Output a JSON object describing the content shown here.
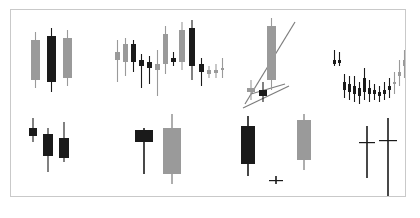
{
  "figure": {
    "title": "",
    "background_color": "#ffffff",
    "border_color": "#c9c9c9",
    "bullish_color": "#9a9a9a",
    "bearish_color": "#1a1a1a",
    "line_color": "#7d7d7d",
    "panel": {
      "x": 10,
      "y": 9,
      "width": 396,
      "height": 188
    }
  },
  "chart_data": {
    "type": "candlestick",
    "title": "",
    "subtitle": "",
    "xlabel": "",
    "ylabel": "",
    "grid": false,
    "legend": null,
    "axis_ticks_visible": false,
    "colors": {
      "up": "#9a9a9a",
      "down": "#1a1a1a",
      "trendline": "#7d7d7d"
    },
    "panels": [
      {
        "id": "panel-1",
        "name": "three-wide-candles",
        "position": {
          "x": 8,
          "y": 12,
          "w": 92,
          "h": 80
        },
        "ylim": [
          0,
          80
        ],
        "candles": [
          {
            "x": 12,
            "open": 62,
            "high": 70,
            "low": 14,
            "close": 22,
            "dir": "up",
            "body_w": 9
          },
          {
            "x": 28,
            "open": 66,
            "high": 74,
            "low": 10,
            "close": 20,
            "dir": "down",
            "body_w": 9
          },
          {
            "x": 44,
            "open": 64,
            "high": 72,
            "low": 16,
            "close": 24,
            "dir": "up",
            "body_w": 9
          }
        ],
        "trendlines": []
      },
      {
        "id": "panel-2",
        "name": "mixed-sequence",
        "position": {
          "x": 100,
          "y": 8,
          "w": 118,
          "h": 88
        },
        "ylim": [
          0,
          88
        ],
        "candles": [
          {
            "x": 4,
            "open": 54,
            "high": 66,
            "low": 24,
            "close": 46,
            "dir": "up",
            "body_w": 5
          },
          {
            "x": 12,
            "open": 62,
            "high": 68,
            "low": 30,
            "close": 44,
            "dir": "up",
            "body_w": 5
          },
          {
            "x": 20,
            "open": 62,
            "high": 66,
            "low": 34,
            "close": 44,
            "dir": "down",
            "body_w": 5
          },
          {
            "x": 28,
            "open": 46,
            "high": 52,
            "low": 18,
            "close": 40,
            "dir": "down",
            "body_w": 5
          },
          {
            "x": 36,
            "open": 44,
            "high": 50,
            "low": 22,
            "close": 38,
            "dir": "down",
            "body_w": 5
          },
          {
            "x": 44,
            "open": 42,
            "high": 56,
            "low": 10,
            "close": 36,
            "dir": "up",
            "body_w": 5
          },
          {
            "x": 52,
            "open": 72,
            "high": 80,
            "low": 32,
            "close": 42,
            "dir": "up",
            "body_w": 5
          },
          {
            "x": 60,
            "open": 48,
            "high": 54,
            "low": 40,
            "close": 44,
            "dir": "down",
            "body_w": 5
          },
          {
            "x": 68,
            "open": 76,
            "high": 84,
            "low": 36,
            "close": 44,
            "dir": "up",
            "body_w": 6
          },
          {
            "x": 78,
            "open": 78,
            "high": 86,
            "low": 26,
            "close": 40,
            "dir": "down",
            "body_w": 6
          },
          {
            "x": 88,
            "open": 42,
            "high": 48,
            "low": 20,
            "close": 34,
            "dir": "down",
            "body_w": 5
          },
          {
            "x": 96,
            "open": 36,
            "high": 40,
            "low": 28,
            "close": 32,
            "dir": "up",
            "body_w": 4
          },
          {
            "x": 103,
            "open": 36,
            "high": 42,
            "low": 28,
            "close": 33,
            "dir": "up",
            "body_w": 4
          },
          {
            "x": 110,
            "open": 38,
            "high": 48,
            "low": 28,
            "close": 36,
            "dir": "up",
            "body_w": 3
          }
        ],
        "trendlines": []
      },
      {
        "id": "panel-3",
        "name": "wedge-breakout-with-trendlines",
        "position": {
          "x": 222,
          "y": 6,
          "w": 94,
          "h": 98
        },
        "ylim": [
          0,
          98
        ],
        "candles": [
          {
            "x": 14,
            "open": 26,
            "high": 34,
            "low": 14,
            "close": 22,
            "dir": "up",
            "body_w": 8
          },
          {
            "x": 26,
            "open": 24,
            "high": 32,
            "low": 12,
            "close": 18,
            "dir": "down",
            "body_w": 8
          },
          {
            "x": 34,
            "open": 88,
            "high": 96,
            "low": 24,
            "close": 34,
            "dir": "up",
            "body_w": 9
          }
        ],
        "trendlines": [
          {
            "name": "upper-trendline",
            "x1": 12,
            "y1": 10,
            "x2": 62,
            "y2": 92
          },
          {
            "name": "lower-trendline",
            "x1": 10,
            "y1": 6,
            "x2": 56,
            "y2": 28
          },
          {
            "name": "breakout-line",
            "x1": 18,
            "y1": 20,
            "x2": 52,
            "y2": 30
          }
        ]
      },
      {
        "id": "panel-4",
        "name": "rounding-bottom-rally",
        "position": {
          "x": 318,
          "y": 6,
          "w": 88,
          "h": 96
        },
        "ylim": [
          0,
          96
        ],
        "candles": [
          {
            "x": 4,
            "open": 52,
            "high": 62,
            "low": 46,
            "close": 48,
            "dir": "down",
            "body_w": 3
          },
          {
            "x": 9,
            "open": 52,
            "high": 60,
            "low": 46,
            "close": 49,
            "dir": "down",
            "body_w": 3
          },
          {
            "x": 14,
            "open": 30,
            "high": 38,
            "low": 14,
            "close": 22,
            "dir": "down",
            "body_w": 3
          },
          {
            "x": 19,
            "open": 28,
            "high": 36,
            "low": 12,
            "close": 20,
            "dir": "down",
            "body_w": 3
          },
          {
            "x": 24,
            "open": 26,
            "high": 36,
            "low": 10,
            "close": 18,
            "dir": "down",
            "body_w": 3
          },
          {
            "x": 29,
            "open": 24,
            "high": 30,
            "low": 8,
            "close": 16,
            "dir": "down",
            "body_w": 3
          },
          {
            "x": 34,
            "open": 34,
            "high": 44,
            "low": 12,
            "close": 20,
            "dir": "down",
            "body_w": 3
          },
          {
            "x": 39,
            "open": 24,
            "high": 32,
            "low": 10,
            "close": 18,
            "dir": "down",
            "body_w": 3
          },
          {
            "x": 44,
            "open": 22,
            "high": 28,
            "low": 12,
            "close": 18,
            "dir": "down",
            "body_w": 3
          },
          {
            "x": 49,
            "open": 20,
            "high": 26,
            "low": 10,
            "close": 16,
            "dir": "down",
            "body_w": 3
          },
          {
            "x": 54,
            "open": 22,
            "high": 30,
            "low": 12,
            "close": 18,
            "dir": "down",
            "body_w": 3
          },
          {
            "x": 59,
            "open": 26,
            "high": 34,
            "low": 14,
            "close": 22,
            "dir": "down",
            "body_w": 3
          },
          {
            "x": 64,
            "open": 30,
            "high": 40,
            "low": 18,
            "close": 28,
            "dir": "up",
            "body_w": 3
          },
          {
            "x": 69,
            "open": 40,
            "high": 52,
            "low": 26,
            "close": 36,
            "dir": "up",
            "body_w": 3
          },
          {
            "x": 74,
            "open": 52,
            "high": 62,
            "low": 34,
            "close": 46,
            "dir": "up",
            "body_w": 3
          },
          {
            "x": 80,
            "open": 84,
            "high": 94,
            "low": 66,
            "close": 74,
            "dir": "down",
            "body_w": 5
          }
        ],
        "trendlines": []
      },
      {
        "id": "panel-5",
        "name": "three-black-crows",
        "position": {
          "x": 8,
          "y": 100,
          "w": 80,
          "h": 80
        },
        "ylim": [
          0,
          80
        ],
        "candles": [
          {
            "x": 10,
            "open": 62,
            "high": 72,
            "low": 48,
            "close": 54,
            "dir": "down",
            "body_w": 8
          },
          {
            "x": 24,
            "open": 56,
            "high": 62,
            "low": 18,
            "close": 34,
            "dir": "down",
            "body_w": 10
          },
          {
            "x": 40,
            "open": 52,
            "high": 68,
            "low": 28,
            "close": 32,
            "dir": "down",
            "body_w": 10
          }
        ],
        "trendlines": []
      },
      {
        "id": "panel-6",
        "name": "bullish-engulfing",
        "position": {
          "x": 110,
          "y": 100,
          "w": 90,
          "h": 82
        },
        "ylim": [
          0,
          82
        ],
        "candles": [
          {
            "x": 14,
            "open": 62,
            "high": 64,
            "low": 18,
            "close": 50,
            "dir": "down",
            "body_w": 18
          },
          {
            "x": 42,
            "open": 18,
            "high": 78,
            "low": 8,
            "close": 64,
            "dir": "up",
            "body_w": 18
          }
        ],
        "trendlines": []
      },
      {
        "id": "panel-7",
        "name": "morning-star",
        "position": {
          "x": 216,
          "y": 100,
          "w": 96,
          "h": 86
        },
        "ylim": [
          0,
          86
        ],
        "candles": [
          {
            "x": 14,
            "open": 70,
            "high": 80,
            "low": 20,
            "close": 32,
            "dir": "down",
            "body_w": 14
          },
          {
            "x": 42,
            "open": 16,
            "high": 20,
            "low": 12,
            "close": 16,
            "dir": "doji",
            "body_w": 14
          },
          {
            "x": 70,
            "open": 36,
            "high": 82,
            "low": 26,
            "close": 76,
            "dir": "up",
            "body_w": 14
          }
        ],
        "trendlines": []
      },
      {
        "id": "panel-8",
        "name": "double-dragonfly-doji",
        "position": {
          "x": 330,
          "y": 100,
          "w": 76,
          "h": 88
        },
        "ylim": [
          0,
          88
        ],
        "candles": [
          {
            "x": 18,
            "open": 56,
            "high": 72,
            "low": 20,
            "close": 56,
            "dir": "doji",
            "body_w": 16
          },
          {
            "x": 38,
            "open": 58,
            "high": 80,
            "low": 2,
            "close": 58,
            "dir": "doji",
            "body_w": 18
          }
        ],
        "trendlines": []
      }
    ]
  }
}
